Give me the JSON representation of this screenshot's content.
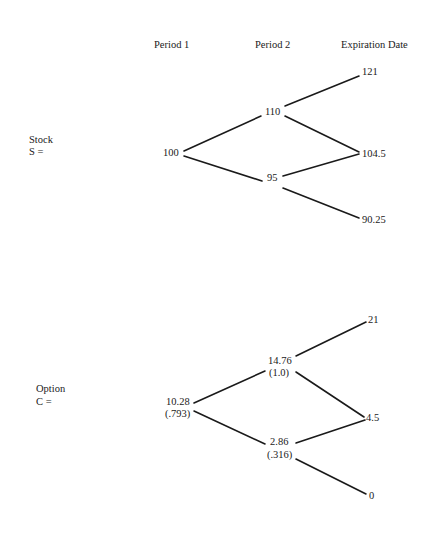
{
  "headers": {
    "period1": "Period 1",
    "period2": "Period 2",
    "expiration": "Expiration Date"
  },
  "stock": {
    "label": "Stock",
    "symbol": "S =",
    "nodes": {
      "p1": "100",
      "p2_up": "110",
      "p2_down": "95",
      "exp_uu": "121",
      "exp_ud": "104.5",
      "exp_dd": "90.25"
    }
  },
  "option": {
    "label": "Option",
    "symbol": "C =",
    "nodes": {
      "p1_value": "10.28",
      "p1_hedge": "(.793)",
      "p2_up_value": "14.76",
      "p2_up_hedge": "(1.0)",
      "p2_down_value": "2.86",
      "p2_down_hedge": "(.316)",
      "exp_uu": "21",
      "exp_ud": "4.5",
      "exp_dd": "0"
    }
  },
  "colors": {
    "ink": "#1a1a1a",
    "background": "#ffffff"
  }
}
